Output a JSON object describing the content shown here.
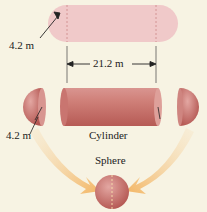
{
  "diagram": {
    "top": {
      "radius_label": "4.2 m",
      "length_label": "21.2 m"
    },
    "bottom": {
      "radius_label": "4.2 m",
      "cylinder_label": "Cylinder",
      "sphere_label": "Sphere"
    },
    "colors": {
      "background": "#f7f3e3",
      "capsule_fill": "#f0c9c9",
      "solid_fill": "#c8706a",
      "arrow_fill": "#f3c27a"
    }
  }
}
